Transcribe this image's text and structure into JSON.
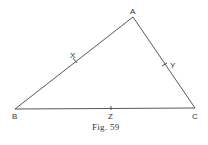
{
  "figure": {
    "caption": "Fig. 59",
    "points": {
      "A": {
        "label": "A",
        "x": 133,
        "y": 17
      },
      "B": {
        "label": "B",
        "x": 15,
        "y": 109
      },
      "C": {
        "label": "C",
        "x": 195,
        "y": 108
      }
    },
    "midpoints": {
      "X": {
        "label": "X",
        "x": 75,
        "y": 61
      },
      "Y": {
        "label": "Y",
        "x": 165,
        "y": 64
      },
      "Z": {
        "label": "Z",
        "x": 111,
        "y": 108
      }
    },
    "stroke_color": "#444444"
  }
}
